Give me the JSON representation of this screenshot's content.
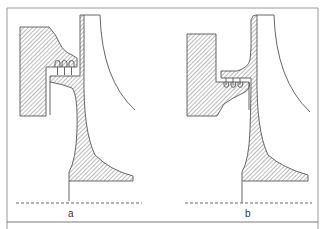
{
  "figure": {
    "colors": {
      "line": "#555555",
      "hatch": "#666666",
      "frame": "#888888",
      "background": "#ffffff"
    }
  },
  "panels": [
    {
      "id": "a",
      "label": "a",
      "seal_teeth": 3,
      "seal_position": "teeth on casing side, above shroud lip"
    },
    {
      "id": "b",
      "label": "b",
      "seal_teeth": 3,
      "seal_position": "teeth hanging into casing groove, below shroud lip"
    }
  ]
}
